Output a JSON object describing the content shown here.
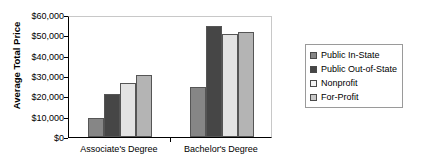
{
  "chart_data": {
    "type": "bar",
    "title": "",
    "xlabel": "",
    "ylabel": "Average Total Price",
    "categories": [
      "Associate's Degree",
      "Bachelor's Degree"
    ],
    "ylim": [
      0,
      60000
    ],
    "ytick_values": [
      0,
      10000,
      20000,
      30000,
      40000,
      50000,
      60000
    ],
    "ytick_labels": [
      "$0",
      "$10,000",
      "$20,000",
      "$30,000",
      "$40,000",
      "$50,000",
      "$60,000"
    ],
    "grid": false,
    "legend_position": "right",
    "series": [
      {
        "name": "Public In-State",
        "color": "#868686",
        "values": [
          9400,
          24500
        ]
      },
      {
        "name": "Public Out-of-State",
        "color": "#464646",
        "values": [
          21200,
          54600
        ]
      },
      {
        "name": "Nonprofit",
        "color": "#e3e3e3",
        "values": [
          26500,
          50600
        ]
      },
      {
        "name": "For-Profit",
        "color": "#b4b4b4",
        "values": [
          30500,
          51600
        ]
      }
    ]
  },
  "legend": {
    "items": [
      {
        "label": "Public In-State",
        "swatch": "#868686"
      },
      {
        "label": "Public Out-of-State",
        "swatch": "#464646"
      },
      {
        "label": "Nonprofit",
        "swatch": "#f4f4f4"
      },
      {
        "label": "For-Profit",
        "swatch": "#c8c8c8"
      }
    ]
  }
}
